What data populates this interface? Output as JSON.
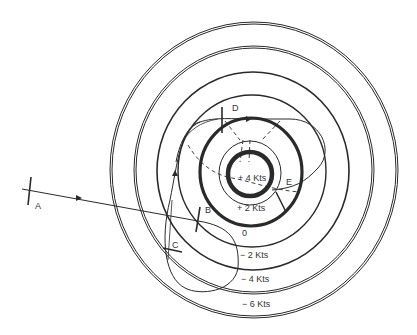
{
  "diagram": {
    "type": "aircraft hold/track pattern over concentric wind-speed rings",
    "points": {
      "A": {
        "label": "A"
      },
      "B": {
        "label": "B"
      },
      "C": {
        "label": "C"
      },
      "D": {
        "label": "D"
      },
      "E": {
        "label": "E"
      }
    },
    "rings": [
      {
        "label": "+ 4 Kts"
      },
      {
        "label": "+ 2 Kts"
      },
      {
        "label": "0"
      },
      {
        "label": "− 2 Kts"
      },
      {
        "label": "− 4 Kts"
      },
      {
        "label": "− 6 Kts"
      }
    ]
  }
}
